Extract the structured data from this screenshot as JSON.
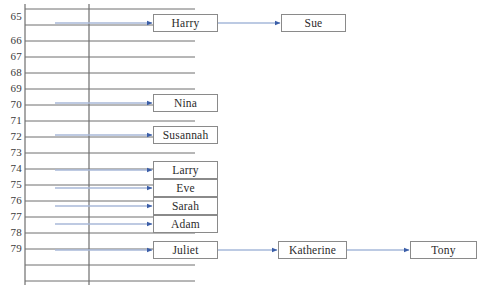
{
  "diagram": {
    "colors": {
      "ladder_line": "#6e6e6e",
      "box_border": "#8a8a8a",
      "arrow_shaft": "#a8b8d8",
      "arrow_head": "#3b5ea8",
      "connector_shaft": "#7a96c8",
      "text": "#2b2b2b",
      "background": "#ffffff"
    },
    "table": {
      "name": "index-column",
      "rows": [
        {
          "label": "65",
          "y": 17
        },
        {
          "label": "66",
          "y": 41
        },
        {
          "label": "67",
          "y": 57
        },
        {
          "label": "68",
          "y": 73
        },
        {
          "label": "69",
          "y": 89
        },
        {
          "label": "70",
          "y": 105
        },
        {
          "label": "71",
          "y": 121
        },
        {
          "label": "72",
          "y": 137
        },
        {
          "label": "73",
          "y": 153
        },
        {
          "label": "74",
          "y": 169
        },
        {
          "label": "75",
          "y": 185
        },
        {
          "label": "76",
          "y": 201
        },
        {
          "label": "77",
          "y": 217
        },
        {
          "label": "78",
          "y": 233
        },
        {
          "label": "79",
          "y": 249
        }
      ],
      "grid": {
        "left_line_x": 25,
        "right_line_x": 89,
        "top_y": 4,
        "bottom_y": 285,
        "first_rung_y": 9,
        "row_height": 16,
        "rung_count": 18
      }
    },
    "nodes": [
      {
        "id": "harry",
        "label": "Harry",
        "x": 153,
        "y": 14,
        "w": 65,
        "h": 18,
        "from_row": "65"
      },
      {
        "id": "sue",
        "label": "Sue",
        "x": 281,
        "y": 14,
        "w": 65,
        "h": 18,
        "from_row": null
      },
      {
        "id": "nina",
        "label": "Nina",
        "x": 153,
        "y": 94,
        "w": 65,
        "h": 18,
        "from_row": "70"
      },
      {
        "id": "susannah",
        "label": "Susannah",
        "x": 153,
        "y": 126,
        "w": 65,
        "h": 18,
        "from_row": "72"
      },
      {
        "id": "larry",
        "label": "Larry",
        "x": 153,
        "y": 161,
        "w": 65,
        "h": 18,
        "from_row": "74"
      },
      {
        "id": "eve",
        "label": "Eve",
        "x": 153,
        "y": 179,
        "w": 65,
        "h": 18,
        "from_row": "75"
      },
      {
        "id": "sarah",
        "label": "Sarah",
        "x": 153,
        "y": 197,
        "w": 65,
        "h": 18,
        "from_row": "76"
      },
      {
        "id": "adam",
        "label": "Adam",
        "x": 153,
        "y": 215,
        "w": 65,
        "h": 18,
        "from_row": "77"
      },
      {
        "id": "juliet",
        "label": "Juliet",
        "x": 153,
        "y": 241,
        "w": 65,
        "h": 18,
        "from_row": "79"
      },
      {
        "id": "katherine",
        "label": "Katherine",
        "x": 278,
        "y": 241,
        "w": 69,
        "h": 18,
        "from_row": null
      },
      {
        "id": "tony",
        "label": "Tony",
        "x": 410,
        "y": 241,
        "w": 67,
        "h": 18,
        "from_row": null
      }
    ],
    "bucket_arrows": [
      {
        "row": "65",
        "x1": 55,
        "x2": 152,
        "y": 23
      },
      {
        "row": "70",
        "x1": 55,
        "x2": 152,
        "y": 103
      },
      {
        "row": "72",
        "x1": 55,
        "x2": 152,
        "y": 135
      },
      {
        "row": "74",
        "x1": 55,
        "x2": 152,
        "y": 170
      },
      {
        "row": "75",
        "x1": 55,
        "x2": 152,
        "y": 188
      },
      {
        "row": "76",
        "x1": 55,
        "x2": 152,
        "y": 206
      },
      {
        "row": "77",
        "x1": 55,
        "x2": 152,
        "y": 224
      },
      {
        "row": "79",
        "x1": 55,
        "x2": 152,
        "y": 250
      }
    ],
    "link_arrows": [
      {
        "from": "harry",
        "to": "sue",
        "x1": 218,
        "x2": 280,
        "y": 23
      },
      {
        "from": "juliet",
        "to": "katherine",
        "x1": 218,
        "x2": 277,
        "y": 250
      },
      {
        "from": "katherine",
        "to": "tony",
        "x1": 347,
        "x2": 409,
        "y": 250
      }
    ]
  }
}
